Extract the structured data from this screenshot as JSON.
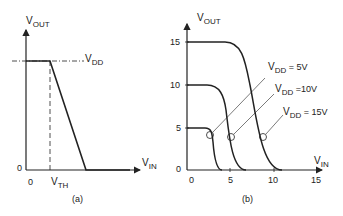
{
  "panel_a": {
    "caption": "(a)",
    "y_axis_label": {
      "main": "V",
      "sub": "OUT"
    },
    "x_axis_label": {
      "main": "V",
      "sub": "IN"
    },
    "origin_y_label": "0",
    "origin_x_label": "0",
    "vdd_label": {
      "main": "V",
      "sub": "DD"
    },
    "vth_label": {
      "main": "V",
      "sub": "TH"
    }
  },
  "panel_b": {
    "caption": "(b)",
    "y_axis_label": {
      "main": "V",
      "sub": "OUT"
    },
    "x_axis_label": {
      "main": "V",
      "sub": "IN"
    },
    "y_ticks": [
      "0",
      "5",
      "10",
      "15"
    ],
    "x_ticks": [
      "0",
      "5",
      "10",
      "15"
    ],
    "annotations": [
      {
        "main": "V",
        "sub": "DD",
        "value": " = 5V"
      },
      {
        "main": "V",
        "sub": "DD",
        "value": " =10V"
      },
      {
        "main": "V",
        "sub": "DD",
        "value": " = 15V"
      }
    ]
  },
  "colors": {
    "line": "#222222",
    "background": "#ffffff"
  }
}
